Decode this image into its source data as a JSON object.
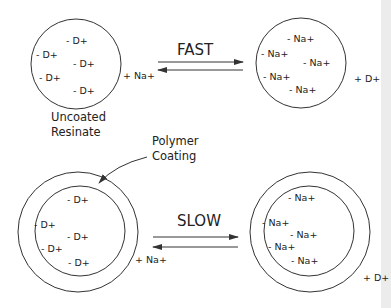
{
  "diagram": {
    "type": "ion-exchange-schematic",
    "top_row": {
      "left_particle": {
        "caption_line1": "Uncoated",
        "caption_line2": "Resinate",
        "ions": [
          "- D+",
          "- D+",
          "- D+",
          "- D+",
          "- D+"
        ],
        "external_ion": "+ Na+"
      },
      "rate_label": "FAST",
      "right_particle": {
        "ions": [
          "- Na+",
          "- Na+",
          "- Na+",
          "- Na+",
          "- Na+"
        ],
        "external_ion": "+ D+"
      }
    },
    "coating_label": {
      "line1": "Polymer",
      "line2": "Coating"
    },
    "bottom_row": {
      "left_particle": {
        "ions": [
          "- D+",
          "- D+",
          "- D+",
          "- D+",
          "- D+"
        ],
        "external_ion": "+ Na+"
      },
      "rate_label": "SLOW",
      "right_particle": {
        "ions": [
          "- Na+",
          "- Na+",
          "- Na+",
          "- Na+",
          "- Na+"
        ],
        "external_ion": "+ D+"
      }
    },
    "colors": {
      "line": "#333333",
      "text": "#222222",
      "background": "#ffffff"
    }
  }
}
